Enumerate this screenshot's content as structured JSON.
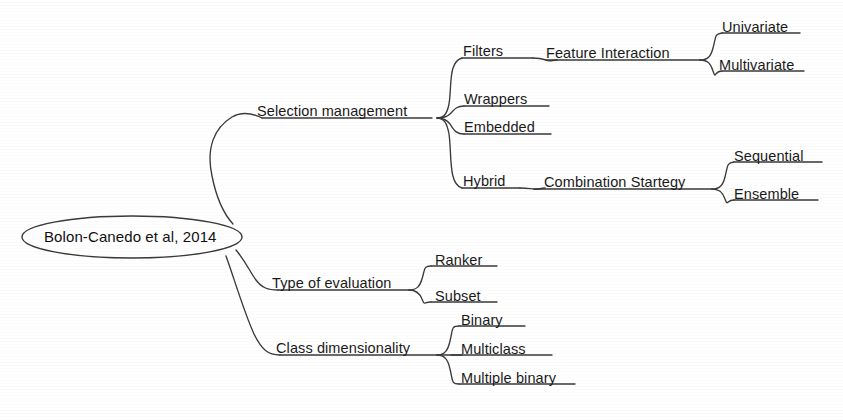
{
  "diagram": {
    "type": "mind-map",
    "orientation": "left-to-right",
    "background_color": "#ffffff",
    "line_color": "#333333",
    "text_color": "#1a1a1a",
    "root": {
      "label": "Bolon-Canedo et al, 2014",
      "shape": "ellipse"
    },
    "branches": [
      {
        "label": "Selection management",
        "children": [
          {
            "label": "Filters",
            "children": [
              {
                "label": "Feature Interaction",
                "children": [
                  {
                    "label": "Univariate"
                  },
                  {
                    "label": "Multivariate"
                  }
                ]
              }
            ]
          },
          {
            "label": "Wrappers",
            "children": []
          },
          {
            "label": "Embedded",
            "children": []
          },
          {
            "label": "Hybrid",
            "children": [
              {
                "label": "Combination Startegy",
                "children": [
                  {
                    "label": "Sequential"
                  },
                  {
                    "label": "Ensemble"
                  }
                ]
              }
            ]
          }
        ]
      },
      {
        "label": "Type of evaluation",
        "children": [
          {
            "label": "Ranker",
            "children": []
          },
          {
            "label": "Subset",
            "children": []
          }
        ]
      },
      {
        "label": "Class dimensionality",
        "children": [
          {
            "label": "Binary",
            "children": []
          },
          {
            "label": "Multiclass",
            "children": []
          },
          {
            "label": "Multiple binary",
            "children": []
          }
        ]
      }
    ],
    "labels": {
      "root": "Bolon-Canedo et al, 2014",
      "selection_management": "Selection management",
      "filters": "Filters",
      "feature_interaction": "Feature Interaction",
      "univariate": "Univariate",
      "multivariate": "Multivariate",
      "wrappers": "Wrappers",
      "embedded": "Embedded",
      "hybrid": "Hybrid",
      "combination_strategy": "Combination Startegy",
      "sequential": "Sequential",
      "ensemble": "Ensemble",
      "type_of_evaluation": "Type of evaluation",
      "ranker": "Ranker",
      "subset": "Subset",
      "class_dimensionality": "Class dimensionality",
      "binary": "Binary",
      "multiclass": "Multiclass",
      "multiple_binary": "Multiple binary"
    }
  }
}
